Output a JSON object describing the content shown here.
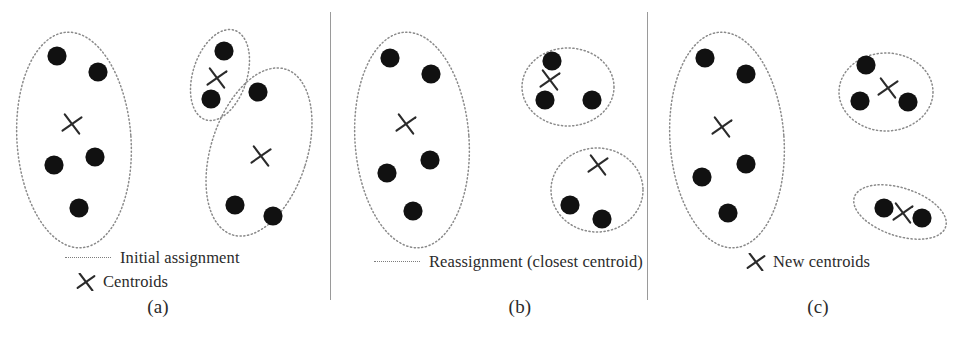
{
  "figure": {
    "width": 962,
    "height": 341,
    "background": "#ffffff",
    "dot_color": "#111111",
    "boundary_color": "#8a8a8a",
    "cross_color": "#2b2b2b",
    "divider_color": "#9a9a9a"
  },
  "panels": [
    {
      "id": "a",
      "caption": "(a)",
      "caption_x": 158,
      "legend": [
        {
          "marker": "dotted-line",
          "label": "Initial assignment"
        },
        {
          "marker": "cross",
          "label": "Centroids"
        }
      ],
      "clusters": [
        {
          "name": "cluster-left",
          "shape": "ellipse",
          "cx": 74,
          "cy": 140,
          "rx": 57,
          "ry": 108,
          "rotate": -4,
          "centroid": {
            "x": 72,
            "y": 124
          },
          "points": [
            {
              "x": 57,
              "y": 56
            },
            {
              "x": 98,
              "y": 72
            },
            {
              "x": 54,
              "y": 165
            },
            {
              "x": 95,
              "y": 157
            },
            {
              "x": 79,
              "y": 208
            }
          ]
        },
        {
          "name": "cluster-top-right-small",
          "shape": "ellipse",
          "cx": 220,
          "cy": 75,
          "rx": 27,
          "ry": 47,
          "rotate": 18,
          "centroid": {
            "x": 217,
            "y": 78
          },
          "points": [
            {
              "x": 224,
              "y": 51
            },
            {
              "x": 211,
              "y": 99
            }
          ]
        },
        {
          "name": "cluster-bottom-right-large",
          "shape": "ellipse",
          "cx": 259,
          "cy": 152,
          "rx": 48,
          "ry": 87,
          "rotate": 18,
          "centroid": {
            "x": 261,
            "y": 156
          },
          "points": [
            {
              "x": 258,
              "y": 92
            },
            {
              "x": 235,
              "y": 205
            },
            {
              "x": 273,
              "y": 216
            }
          ]
        }
      ]
    },
    {
      "id": "b",
      "caption": "(b)",
      "caption_x": 520,
      "legend": [
        {
          "marker": "dotted-line",
          "label": "Reassignment (closest centroid)"
        }
      ],
      "clusters": [
        {
          "name": "cluster-left",
          "shape": "ellipse",
          "cx": 412,
          "cy": 140,
          "rx": 57,
          "ry": 108,
          "rotate": -4,
          "centroid": {
            "x": 406,
            "y": 124
          },
          "points": [
            {
              "x": 390,
              "y": 58
            },
            {
              "x": 431,
              "y": 74
            },
            {
              "x": 387,
              "y": 173
            },
            {
              "x": 430,
              "y": 160
            },
            {
              "x": 413,
              "y": 211
            }
          ]
        },
        {
          "name": "cluster-top-right",
          "shape": "ellipse",
          "cx": 568,
          "cy": 87,
          "rx": 46,
          "ry": 39,
          "rotate": 0,
          "centroid": {
            "x": 550,
            "y": 80
          },
          "points": [
            {
              "x": 552,
              "y": 61
            },
            {
              "x": 545,
              "y": 100
            },
            {
              "x": 592,
              "y": 100
            }
          ]
        },
        {
          "name": "cluster-bottom-right",
          "shape": "ellipse",
          "cx": 597,
          "cy": 190,
          "rx": 46,
          "ry": 42,
          "rotate": 0,
          "centroid": {
            "x": 598,
            "y": 165
          },
          "points": [
            {
              "x": 570,
              "y": 205
            },
            {
              "x": 602,
              "y": 219
            }
          ]
        }
      ]
    },
    {
      "id": "c",
      "caption": "(c)",
      "caption_x": 818,
      "legend": [
        {
          "marker": "cross",
          "label": "New centroids"
        }
      ],
      "clusters": [
        {
          "name": "cluster-left",
          "shape": "ellipse",
          "cx": 727,
          "cy": 140,
          "rx": 57,
          "ry": 108,
          "rotate": -4,
          "centroid": {
            "x": 722,
            "y": 127
          },
          "points": [
            {
              "x": 705,
              "y": 58
            },
            {
              "x": 746,
              "y": 74
            },
            {
              "x": 702,
              "y": 177
            },
            {
              "x": 746,
              "y": 164
            },
            {
              "x": 728,
              "y": 213
            }
          ]
        },
        {
          "name": "cluster-top-right",
          "shape": "ellipse",
          "cx": 886,
          "cy": 92,
          "rx": 47,
          "ry": 39,
          "rotate": 0,
          "centroid": {
            "x": 888,
            "y": 88
          },
          "points": [
            {
              "x": 866,
              "y": 65
            },
            {
              "x": 860,
              "y": 101
            },
            {
              "x": 908,
              "y": 102
            }
          ]
        },
        {
          "name": "cluster-bottom-right",
          "shape": "ellipse",
          "cx": 900,
          "cy": 212,
          "rx": 48,
          "ry": 24,
          "rotate": 18,
          "centroid": {
            "x": 903,
            "y": 213
          },
          "points": [
            {
              "x": 884,
              "y": 208
            },
            {
              "x": 922,
              "y": 218
            }
          ]
        }
      ]
    }
  ],
  "dividers": [
    {
      "x": 330
    },
    {
      "x": 647
    }
  ]
}
